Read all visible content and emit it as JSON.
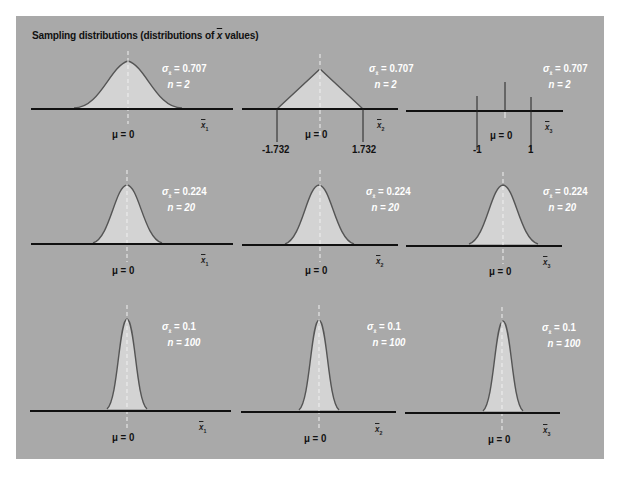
{
  "title": {
    "prefix": "Sampling distributions (distributions of ",
    "symbol": "x",
    "suffix": " values)"
  },
  "colors": {
    "background": "#a9a9a9",
    "fill": "#d3d3d3",
    "curve": "#555555",
    "axis": "#111111",
    "stat_text": "#ffffff",
    "mean_line": "#f0f0f0"
  },
  "labels": {
    "mu": "μ = 0",
    "sigma_symbol": "σ",
    "sigma_sub": "x̄"
  },
  "rows": [
    {
      "n_label": "n = 2",
      "sigma_label": " = 0.707",
      "panels": [
        {
          "shape": "normal-wide",
          "xvar": "x",
          "xsub": "1"
        },
        {
          "shape": "triangle",
          "xvar": "x",
          "xsub": "2",
          "ticks": [
            "-1.732",
            "1.732"
          ]
        },
        {
          "shape": "two-point-spikes",
          "xvar": "x",
          "xsub": "3",
          "ticks": [
            "-1",
            "1"
          ]
        }
      ]
    },
    {
      "n_label": "n = 20",
      "sigma_label": " = 0.224",
      "panels": [
        {
          "shape": "normal",
          "xvar": "x",
          "xsub": "1"
        },
        {
          "shape": "normal",
          "xvar": "x",
          "xsub": "2"
        },
        {
          "shape": "normal",
          "xvar": "x",
          "xsub": "3"
        }
      ]
    },
    {
      "n_label": "n = 100",
      "sigma_label": " = 0.1",
      "panels": [
        {
          "shape": "normal-narrow",
          "xvar": "x",
          "xsub": "1"
        },
        {
          "shape": "normal-narrow",
          "xvar": "x",
          "xsub": "2"
        },
        {
          "shape": "normal-narrow",
          "xvar": "x",
          "xsub": "3"
        }
      ]
    }
  ]
}
